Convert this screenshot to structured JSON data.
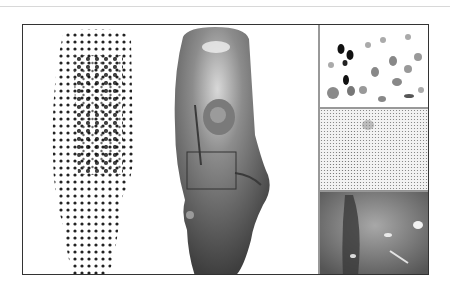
{
  "figure": {
    "panels": [
      {
        "id": "dotted-statue",
        "description": "Statue surface sampled with black dots of varying size"
      },
      {
        "id": "shaded-statue",
        "description": "Smooth gray rendered statue with highlighted inset rectangle"
      },
      {
        "id": "closeup-dots",
        "description": "Close-up of gray elliptical dots"
      },
      {
        "id": "closeup-pattern",
        "description": "Close-up of fine dense dot pattern"
      },
      {
        "id": "closeup-shaded",
        "description": "Close-up of glossy shaded surface"
      }
    ],
    "colors": {
      "frame": "#333333",
      "statue_gray": "#8a8a8a",
      "dot": "#222222",
      "background": "#ffffff"
    }
  }
}
